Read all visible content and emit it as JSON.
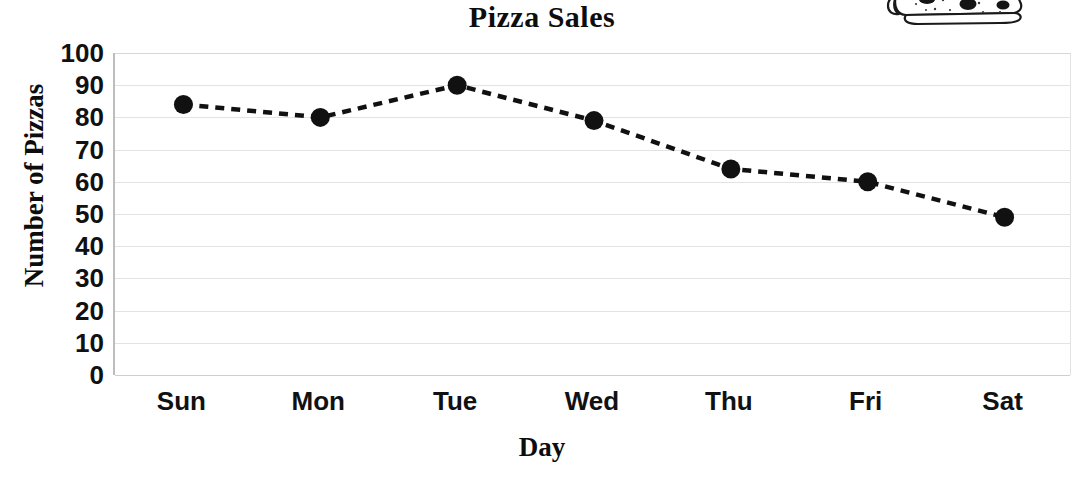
{
  "chart_data": {
    "type": "line",
    "title": "Pizza Sales",
    "xlabel": "Day",
    "ylabel": "Number of Pizzas",
    "categories": [
      "Sun",
      "Mon",
      "Tue",
      "Wed",
      "Thu",
      "Fri",
      "Sat"
    ],
    "values": [
      84,
      80,
      90,
      79,
      64,
      60,
      49
    ],
    "series": [
      {
        "name": "Number of Pizzas",
        "values": [
          84,
          80,
          90,
          79,
          64,
          60,
          49
        ]
      }
    ],
    "ylim": [
      0,
      100
    ],
    "y_ticks": [
      100,
      90,
      80,
      70,
      60,
      50,
      40,
      30,
      20,
      10,
      0
    ],
    "y_tick_labels": [
      "100",
      "90",
      "80",
      "70",
      "60",
      "50",
      "40",
      "30",
      "20",
      "10",
      "0"
    ],
    "grid": true,
    "grid_axis": "y",
    "legend": false,
    "legend_position": "none",
    "line_style": "dashed",
    "line_color": "#111111",
    "marker": "circle",
    "marker_color": "#111111",
    "background_color": "#ffffff",
    "gridline_color": "#e3e3e3",
    "annotations": [
      {
        "name": "pizza-slice-clipart",
        "description": "Hand-drawn pizza slice illustration in the top-right corner, partially cropped at the top edge"
      }
    ]
  }
}
